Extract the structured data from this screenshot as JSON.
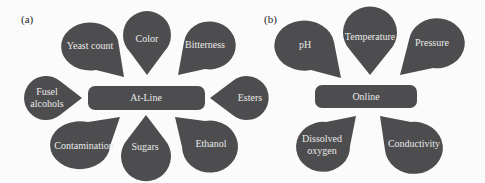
{
  "panels": [
    {
      "label": "(a)",
      "center": "At-Line",
      "nodes": [
        {
          "text": "Yeast count"
        },
        {
          "text": "Color"
        },
        {
          "text": "Bitterness"
        },
        {
          "text": "Fusel",
          "text2": "alcohols"
        },
        {
          "text": "Esters"
        },
        {
          "text": "Contamination"
        },
        {
          "text": "Sugars"
        },
        {
          "text": "Ethanol"
        }
      ]
    },
    {
      "label": "(b)",
      "center": "Online",
      "nodes": [
        {
          "text": "pH"
        },
        {
          "text": "Temperature"
        },
        {
          "text": "Pressure"
        },
        {
          "text": "Dissolved",
          "text2": "oxygen"
        },
        {
          "text": "Conductivity"
        }
      ]
    }
  ],
  "colors": {
    "shape": "#4d4d4f",
    "text": "#e9e9e9",
    "background": "#fbfbfb"
  }
}
